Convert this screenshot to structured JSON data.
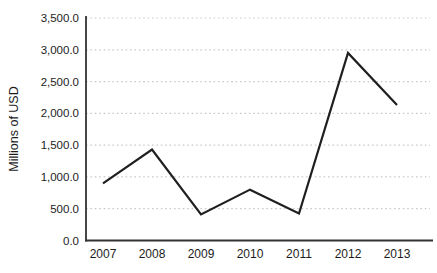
{
  "chart_data": {
    "type": "line",
    "title": "",
    "xlabel": "",
    "ylabel": "Millions of USD",
    "categories": [
      "2007",
      "2008",
      "2009",
      "2010",
      "2011",
      "2012",
      "2013"
    ],
    "series": [
      {
        "name": "Millions of USD",
        "values": [
          900,
          1430,
          410,
          800,
          425,
          2950,
          2130
        ]
      }
    ],
    "ylim": [
      0,
      3500
    ],
    "ytick_step": 500,
    "ytick_labels": [
      "0.0",
      "500.0",
      "1,000.0",
      "1,500.0",
      "2,000.0",
      "2,500.0",
      "3,000.0",
      "3,500.0"
    ],
    "grid": "horizontal-dotted",
    "legend": "none",
    "marker": "none",
    "colors": {
      "line": "#1f1f1f",
      "axis": "#333333",
      "grid": "#c9c9c9",
      "text": "#1c1c1c",
      "background": "#ffffff"
    }
  }
}
